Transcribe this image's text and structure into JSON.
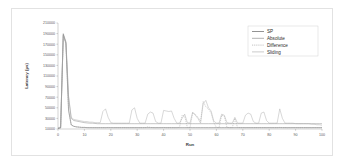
{
  "chart_data": {
    "type": "line",
    "title": "",
    "xlabel": "Run",
    "ylabel": "Latency (µs)",
    "xlim": [
      0,
      100
    ],
    "ylim": [
      10000,
      210000
    ],
    "grid": false,
    "legend_position": "top-right",
    "x_ticks": [
      0,
      10,
      20,
      30,
      40,
      50,
      60,
      70,
      80,
      90,
      100
    ],
    "x_tick_labels": [
      "0",
      "10",
      "20",
      "30",
      "40",
      "50",
      "60",
      "70",
      "80",
      "90",
      "100"
    ],
    "y_ticks": [
      10000,
      30000,
      50000,
      70000,
      90000,
      110000,
      130000,
      150000,
      170000,
      190000,
      210000
    ],
    "y_tick_labels": [
      "10000",
      "30000",
      "50000",
      "70000",
      "90000",
      "110000",
      "130000",
      "150000",
      "170000",
      "190000",
      "210000"
    ],
    "x": [
      0,
      1,
      2,
      3,
      4,
      5,
      6,
      7,
      8,
      9,
      10,
      11,
      12,
      13,
      14,
      15,
      16,
      17,
      18,
      19,
      20,
      21,
      22,
      23,
      24,
      25,
      26,
      27,
      28,
      29,
      30,
      31,
      32,
      33,
      34,
      35,
      36,
      37,
      38,
      39,
      40,
      41,
      42,
      43,
      44,
      45,
      46,
      47,
      48,
      49,
      50,
      51,
      52,
      53,
      54,
      55,
      56,
      57,
      58,
      59,
      60,
      61,
      62,
      63,
      64,
      65,
      66,
      67,
      68,
      69,
      70,
      71,
      72,
      73,
      74,
      75,
      76,
      77,
      78,
      79,
      80,
      81,
      82,
      83,
      84,
      85,
      86,
      87,
      88,
      89,
      90,
      91,
      92,
      93,
      94,
      95,
      96,
      97,
      98,
      99,
      100
    ],
    "series": [
      {
        "name": "SP",
        "color": "#4a4a4a",
        "dash": "none",
        "values": [
          11000,
          12000,
          188000,
          172000,
          46000,
          18000,
          15000,
          14000,
          13500,
          13000,
          13000,
          12500,
          12500,
          12500,
          12500,
          12500,
          12500,
          12500,
          12500,
          12500,
          12500,
          12500,
          12500,
          12500,
          12500,
          12500,
          12500,
          12500,
          12500,
          12500,
          12500,
          12500,
          12500,
          12500,
          12500,
          12500,
          12500,
          12500,
          12500,
          12500,
          12500,
          12500,
          12500,
          12500,
          12500,
          12500,
          12500,
          12500,
          12500,
          12500,
          12500,
          12500,
          12500,
          12500,
          12500,
          12500,
          12500,
          12500,
          12500,
          12500,
          12500,
          12500,
          12500,
          12500,
          12500,
          12500,
          12500,
          12500,
          12500,
          12500,
          12500,
          12500,
          12500,
          12500,
          12500,
          12500,
          12500,
          12500,
          12500,
          12500,
          12500,
          12500,
          12500,
          12500,
          12500,
          12500,
          12500,
          12500,
          12500,
          12500,
          12500,
          12500,
          12500,
          12500,
          12500,
          12500,
          12500,
          12500,
          12500,
          12500,
          12500
        ]
      },
      {
        "name": "Absolute",
        "color": "#7d7d7d",
        "dash": "none",
        "values": [
          11500,
          13000,
          190000,
          175000,
          70000,
          30000,
          26000,
          25000,
          24000,
          23000,
          22000,
          21500,
          21000,
          21000,
          20500,
          20000,
          20000,
          20000,
          20000,
          20000,
          20000,
          20000,
          20000,
          20000,
          20000,
          20000,
          20000,
          20000,
          20000,
          20000,
          20000,
          20000,
          20000,
          20000,
          20000,
          20000,
          20000,
          20000,
          20000,
          20000,
          20000,
          20000,
          20000,
          20000,
          20000,
          20000,
          20000,
          20000,
          20000,
          20000,
          20000,
          20000,
          20000,
          20000,
          20000,
          20000,
          20000,
          20000,
          20000,
          20000,
          20000,
          20000,
          20000,
          20000,
          20000,
          20000,
          20000,
          20000,
          20000,
          20000,
          20000,
          20000,
          20000,
          20000,
          20000,
          20000,
          20000,
          20000,
          20000,
          20000,
          20000,
          20000,
          20000,
          20000,
          20000,
          20000,
          20000,
          20000,
          20000,
          20000,
          20000,
          20000,
          20000,
          20000,
          20000,
          20000,
          20000,
          20000,
          20000,
          20000,
          20000
        ]
      },
      {
        "name": "Difference",
        "color": "#9a9a9a",
        "dash": "1.2,0.9",
        "values": [
          11000,
          12000,
          185000,
          170000,
          44000,
          17000,
          15000,
          14000,
          13500,
          13000,
          13000,
          12800,
          12800,
          12500,
          12500,
          12500,
          12500,
          12500,
          12500,
          13000,
          12500,
          12500,
          12500,
          12500,
          12500,
          12500,
          12500,
          12500,
          12500,
          12500,
          12500,
          12500,
          12500,
          12500,
          14000,
          13000,
          12500,
          12500,
          12500,
          12500,
          13000,
          12500,
          12500,
          12500,
          12500,
          12500,
          13000,
          36000,
          34000,
          13000,
          12500,
          40000,
          38000,
          32000,
          25000,
          62000,
          52000,
          48000,
          40000,
          22000,
          13000,
          12500,
          36000,
          34000,
          13000,
          12500,
          12500,
          30000,
          13000,
          12500,
          12500,
          12500,
          12500,
          12500,
          12500,
          12500,
          12500,
          12500,
          12500,
          12500,
          12500,
          12500,
          12500,
          12500,
          13000,
          12500,
          12500,
          12500,
          12500,
          12500,
          12500,
          12500,
          12500,
          12500,
          12500,
          12500,
          12500,
          12500,
          12500,
          12500,
          12500
        ]
      },
      {
        "name": "Sliding",
        "color": "#a8a8a8",
        "dash": "none",
        "values": [
          12000,
          14000,
          187000,
          173000,
          72000,
          32000,
          28000,
          27000,
          26000,
          25000,
          24000,
          24000,
          23000,
          23000,
          22000,
          22000,
          22000,
          43000,
          48000,
          32000,
          22000,
          21000,
          21000,
          21000,
          21000,
          21000,
          21000,
          21000,
          46000,
          50000,
          30000,
          21000,
          21000,
          21000,
          38000,
          42000,
          40000,
          24000,
          21000,
          21000,
          45000,
          44000,
          43000,
          44000,
          30000,
          21000,
          21000,
          30000,
          38000,
          22000,
          21000,
          42000,
          36000,
          30000,
          21000,
          58000,
          64000,
          50000,
          44000,
          25000,
          21000,
          21000,
          38000,
          36000,
          22000,
          21000,
          21000,
          32000,
          21000,
          21000,
          21000,
          36000,
          40000,
          38000,
          24000,
          21000,
          21000,
          40000,
          42000,
          26000,
          21000,
          21000,
          21000,
          21000,
          48000,
          30000,
          21000,
          21000,
          21000,
          21000,
          20000,
          20000,
          20000,
          20000,
          20000,
          20000,
          19000,
          19000,
          18000,
          18000,
          17000
        ]
      }
    ]
  },
  "legend": {
    "items": [
      {
        "label": "SP"
      },
      {
        "label": "Absolute"
      },
      {
        "label": "Difference"
      },
      {
        "label": "Sliding"
      }
    ]
  }
}
